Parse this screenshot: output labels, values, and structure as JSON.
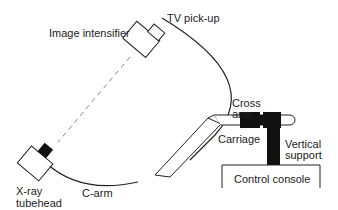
{
  "diagram": {
    "type": "mobile C-arm fluoroscopy unit",
    "labels": {
      "image_intensifier": "Image intensifier",
      "tv_pickup": "TV pick-up",
      "cross_arm_1": "Cross",
      "cross_arm_2": "arm",
      "carriage": "Carriage",
      "vertical_support_1": "Vertical",
      "vertical_support_2": "support",
      "control_console": "Control console",
      "xray_1": "X-ray",
      "xray_2": "tubehead",
      "c_arm": "C-arm"
    },
    "colors": {
      "line": "#222222",
      "fill_dark": "#111111",
      "beam": "#888888",
      "background": "#ffffff"
    }
  }
}
